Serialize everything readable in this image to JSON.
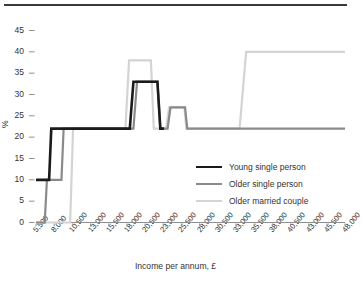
{
  "chart_data": {
    "type": "line",
    "title": "",
    "subtitle": "",
    "xlabel": "Income per annum, £",
    "ylabel": "%",
    "grid": false,
    "legend_position": "inside-right",
    "x_tick_labels": [
      "5,500",
      "8,000",
      "10,500",
      "13,000",
      "15,500",
      "18,000",
      "20,500",
      "23,000",
      "25,500",
      "28,000",
      "30,500",
      "33,000",
      "35,500",
      "38,000",
      "40,500",
      "43,000",
      "45,500",
      "48,000"
    ],
    "x_tick_values": [
      5500,
      8000,
      10500,
      13000,
      15500,
      18000,
      20500,
      23000,
      25500,
      28000,
      30500,
      33000,
      35500,
      38000,
      40500,
      43000,
      45500,
      48000
    ],
    "y_tick_labels": [
      "0",
      "5",
      "10",
      "15",
      "20",
      "25",
      "30",
      "35",
      "40",
      "45"
    ],
    "y_tick_values": [
      0,
      5,
      10,
      15,
      20,
      25,
      30,
      35,
      40,
      45
    ],
    "xlim": [
      5500,
      48000
    ],
    "ylim": [
      0,
      45
    ],
    "series": [
      {
        "name": "Young single person",
        "color": "#1a1a1a",
        "width": 2.6,
        "points": [
          [
            5500,
            10
          ],
          [
            7300,
            10
          ],
          [
            7600,
            22
          ],
          [
            18400,
            22
          ],
          [
            18900,
            33
          ],
          [
            22200,
            33
          ],
          [
            22600,
            22
          ],
          [
            23100,
            22
          ]
        ]
      },
      {
        "name": "Older single person",
        "color": "#8a8a8a",
        "width": 2.2,
        "points": [
          [
            5500,
            0
          ],
          [
            6700,
            0
          ],
          [
            7000,
            10
          ],
          [
            9000,
            10
          ],
          [
            9300,
            22
          ],
          [
            18900,
            22
          ],
          [
            19400,
            33
          ],
          [
            22200,
            33
          ],
          [
            22600,
            22
          ],
          [
            23600,
            22
          ],
          [
            24000,
            27
          ],
          [
            26000,
            27
          ],
          [
            26300,
            22
          ],
          [
            48000,
            22
          ]
        ]
      },
      {
        "name": "Older married couple",
        "color": "#d4d4d4",
        "width": 2.2,
        "points": [
          [
            5500,
            0
          ],
          [
            10200,
            0
          ],
          [
            10600,
            22
          ],
          [
            17800,
            22
          ],
          [
            18300,
            38
          ],
          [
            21300,
            38
          ],
          [
            21700,
            22
          ],
          [
            23400,
            22
          ],
          [
            23800,
            27
          ],
          [
            25900,
            27
          ],
          [
            26200,
            22
          ],
          [
            33500,
            22
          ],
          [
            34400,
            40
          ],
          [
            48000,
            40
          ]
        ]
      }
    ]
  },
  "legend": {
    "items": [
      {
        "label": "Young single person",
        "color": "#1a1a1a"
      },
      {
        "label": "Older single person",
        "color": "#8a8a8a"
      },
      {
        "label": "Older married couple",
        "color": "#d4d4d4"
      }
    ]
  }
}
